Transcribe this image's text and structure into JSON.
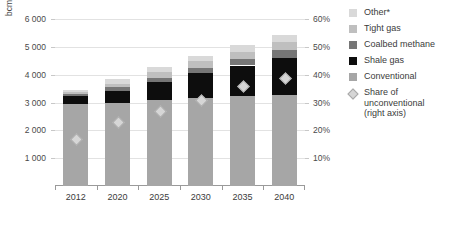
{
  "chart_data": {
    "type": "bar",
    "subtype": "stacked-bar-with-line-markers",
    "title": "",
    "xlabel": "",
    "ylabel": "bcm",
    "y2label": "",
    "categories": [
      "2012",
      "2020",
      "2025",
      "2030",
      "2035",
      "2040"
    ],
    "ylim": [
      0,
      6000
    ],
    "y_ticks": [
      "1 000",
      "2 000",
      "3 000",
      "4 000",
      "5 000",
      "6 000"
    ],
    "y_tick_values": [
      1000,
      2000,
      3000,
      4000,
      5000,
      6000
    ],
    "y2lim": [
      0,
      60
    ],
    "y2_ticks": [
      "10%",
      "20%",
      "30%",
      "40%",
      "50%",
      "60%"
    ],
    "y2_tick_values": [
      10,
      20,
      30,
      40,
      50,
      60
    ],
    "grid": true,
    "legend_position": "right",
    "series": [
      {
        "name": "Conventional",
        "color": "#a6a6a6",
        "axis": "left",
        "values": [
          2950,
          3000,
          3100,
          3180,
          3230,
          3280
        ]
      },
      {
        "name": "Shale gas",
        "color": "#0d0d0d",
        "axis": "left",
        "values": [
          300,
          420,
          620,
          870,
          1100,
          1320
        ]
      },
      {
        "name": "Coalbed methane",
        "color": "#767676",
        "axis": "left",
        "values": [
          70,
          130,
          160,
          200,
          250,
          300
        ]
      },
      {
        "name": "Tight gas",
        "color": "#bfbfbf",
        "axis": "left",
        "values": [
          60,
          130,
          200,
          230,
          250,
          280
        ]
      },
      {
        "name": "Other*",
        "color": "#d9d9d9",
        "axis": "left",
        "values": [
          70,
          150,
          180,
          200,
          230,
          250
        ]
      }
    ],
    "totals": [
      3450,
      3830,
      4260,
      4680,
      5060,
      5430
    ],
    "marker_series": {
      "name": "Share of unconventional (right axis)",
      "label": "Share of\nunconventional\n(right axis)",
      "color": "#d6d6d6",
      "edge_color": "#a8a8a8",
      "shape": "diamond",
      "axis": "right",
      "unit": "%",
      "values": [
        17,
        23,
        27,
        31,
        36,
        39
      ]
    }
  },
  "legend": {
    "items": [
      {
        "label": "Other*",
        "color": "#d9d9d9",
        "shape": "square"
      },
      {
        "label": "Tight gas",
        "color": "#bfbfbf",
        "shape": "square"
      },
      {
        "label": "Coalbed methane",
        "color": "#767676",
        "shape": "square"
      },
      {
        "label": "Shale gas",
        "color": "#0d0d0d",
        "shape": "square"
      },
      {
        "label": "Conventional",
        "color": "#a6a6a6",
        "shape": "square"
      },
      {
        "label": "Share of\nunconventional\n(right axis)",
        "color": "#d6d6d6",
        "shape": "diamond"
      }
    ]
  }
}
